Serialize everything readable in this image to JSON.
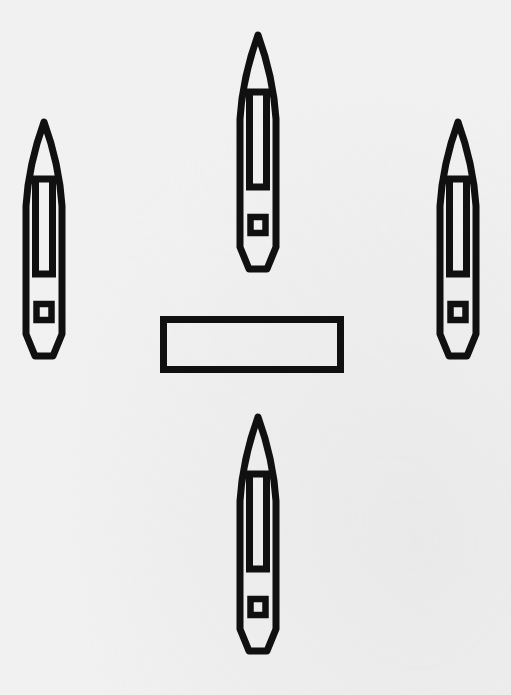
{
  "figure": {
    "background_color": "#f1f1f1",
    "ink_color": "#101010",
    "canvas": {
      "width": 511,
      "height": 695
    },
    "style": "black line art, patent-style technical figure, scanned"
  },
  "objects": [
    {
      "id": "vessel-left",
      "label": "left vessel",
      "shape": "pointed-bow elongated hull",
      "orientation": "bow up",
      "bbox": {
        "x": 22,
        "y": 120,
        "width": 46,
        "height": 240
      },
      "features": [
        "bow-triangle-cutout",
        "long-slot",
        "small-square-port"
      ]
    },
    {
      "id": "vessel-top",
      "label": "top vessel",
      "shape": "pointed-bow elongated hull",
      "orientation": "bow up",
      "bbox": {
        "x": 236,
        "y": 33,
        "width": 44,
        "height": 242
      },
      "features": [
        "bow-triangle-cutout",
        "long-slot",
        "small-square-port"
      ]
    },
    {
      "id": "vessel-right",
      "label": "right vessel",
      "shape": "pointed-bow elongated hull",
      "orientation": "bow up",
      "bbox": {
        "x": 436,
        "y": 120,
        "width": 45,
        "height": 240
      },
      "features": [
        "bow-triangle-cutout",
        "long-slot",
        "small-square-port"
      ]
    },
    {
      "id": "vessel-bottom",
      "label": "bottom vessel",
      "shape": "pointed-bow elongated hull",
      "orientation": "bow up",
      "bbox": {
        "x": 236,
        "y": 415,
        "width": 44,
        "height": 243
      },
      "features": [
        "bow-triangle-cutout",
        "long-slot",
        "small-square-port"
      ]
    },
    {
      "id": "center-bar",
      "label": "center rectangular bar",
      "shape": "hollow rectangle",
      "orientation": "horizontal",
      "bbox": {
        "x": 160,
        "y": 316,
        "width": 184,
        "height": 57
      },
      "stroke_width": 7
    }
  ],
  "counts": {
    "vessels": 4,
    "bars": 1
  }
}
